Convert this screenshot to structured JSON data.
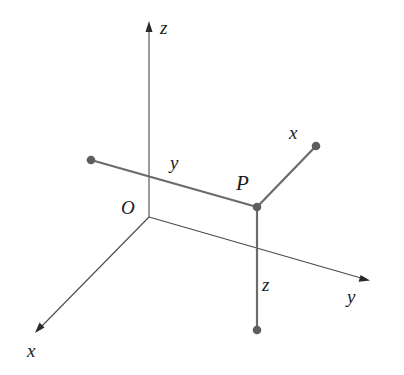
{
  "diagram": {
    "type": "3d-coordinate-system",
    "colors": {
      "axis": "#4a4a4a",
      "segment": "#6b6b6b",
      "point": "#5e5e5e",
      "label": "#1a1a1a"
    },
    "origin": {
      "label": "O",
      "px": [
        149,
        217
      ]
    },
    "axes": [
      {
        "name": "z",
        "label": "z",
        "from": [
          149,
          217
        ],
        "to": [
          149,
          22
        ],
        "label_pos": [
          160,
          34
        ]
      },
      {
        "name": "y",
        "label": "y",
        "from": [
          149,
          217
        ],
        "to": [
          369,
          280
        ],
        "label_pos": [
          347,
          303
        ]
      },
      {
        "name": "x",
        "label": "x",
        "from": [
          149,
          217
        ],
        "to": [
          35,
          333
        ],
        "label_pos": [
          27,
          357
        ]
      }
    ],
    "point": {
      "label": "P",
      "px": [
        257,
        207
      ],
      "label_pos": [
        236,
        190
      ]
    },
    "segments": [
      {
        "name": "y-segment",
        "label": "y",
        "from": [
          91,
          160
        ],
        "to": [
          257,
          207
        ],
        "label_pos": [
          170,
          169
        ]
      },
      {
        "name": "x-segment",
        "label": "x",
        "from": [
          257,
          207
        ],
        "to": [
          316,
          146
        ],
        "label_pos": [
          289,
          139
        ]
      },
      {
        "name": "z-segment",
        "label": "z",
        "from": [
          257,
          207
        ],
        "to": [
          257,
          330
        ],
        "label_pos": [
          262,
          291
        ]
      }
    ],
    "labels": {
      "origin": "O",
      "point": "P",
      "axis_x": "x",
      "axis_y": "y",
      "axis_z": "z",
      "seg_x": "x",
      "seg_y": "y",
      "seg_z": "z"
    }
  }
}
